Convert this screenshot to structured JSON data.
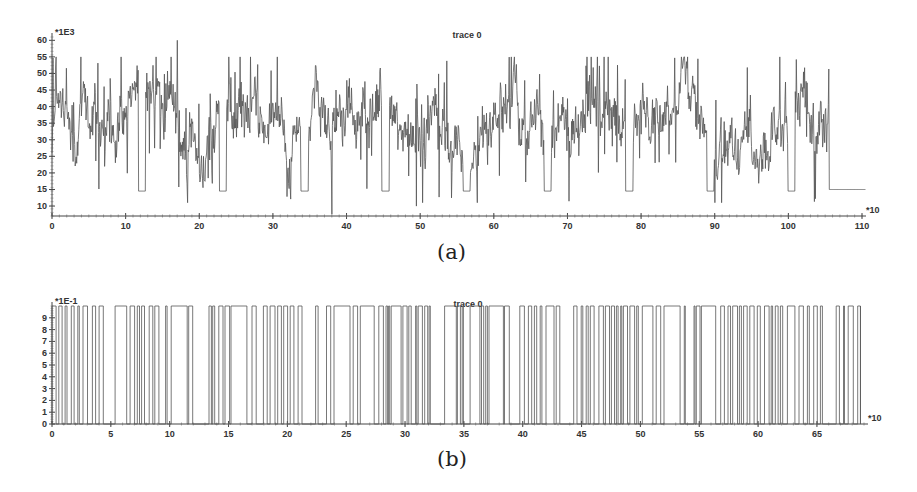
{
  "chart_data": [
    {
      "id": "a",
      "type": "line",
      "title": "trace 0",
      "caption": "(a)",
      "y_multiplier_label": "*1E3",
      "x_multiplier_label": "*10",
      "xlabel": "",
      "ylabel": "",
      "xlim": [
        0,
        110
      ],
      "ylim": [
        7,
        61
      ],
      "x_ticks": [
        0,
        10,
        20,
        30,
        40,
        50,
        60,
        70,
        80,
        90,
        100,
        110
      ],
      "y_ticks": [
        10,
        15,
        20,
        25,
        30,
        35,
        40,
        45,
        50,
        55,
        60
      ],
      "grid": false,
      "description": "Noisy signal oscillating mostly between ~15 and ~55 (x1E3), mean ~33, with periodic flat plateaus at ~14.5 (x1E3) about every 11 units; after x~105.5 the signal stays flat at ~15.",
      "plateaus": [
        {
          "x_start": 11.7,
          "x_end": 12.7,
          "y": 14.5
        },
        {
          "x_start": 22.7,
          "x_end": 23.7,
          "y": 14.5
        },
        {
          "x_start": 33.8,
          "x_end": 34.8,
          "y": 14.5
        },
        {
          "x_start": 44.8,
          "x_end": 45.8,
          "y": 14.5
        },
        {
          "x_start": 55.8,
          "x_end": 56.8,
          "y": 14.5
        },
        {
          "x_start": 66.8,
          "x_end": 67.8,
          "y": 14.5
        },
        {
          "x_start": 77.9,
          "x_end": 78.9,
          "y": 14.5
        },
        {
          "x_start": 88.9,
          "x_end": 89.9,
          "y": 14.5
        },
        {
          "x_start": 99.9,
          "x_end": 100.9,
          "y": 14.5
        },
        {
          "x_start": 105.5,
          "x_end": 110.5,
          "y": 15
        }
      ],
      "notable_points": [
        {
          "x": 17,
          "y": 60,
          "note": "global max"
        },
        {
          "x": 38,
          "y": 7.5,
          "note": "global min spike"
        },
        {
          "x": 49.5,
          "y": 10,
          "note": "low spike"
        }
      ],
      "series": [
        {
          "name": "trace 0",
          "mean": 33,
          "min": 7.5,
          "max": 60,
          "color": "#555555"
        }
      ]
    },
    {
      "id": "b",
      "type": "line",
      "title": "trace 0",
      "caption": "(b)",
      "y_multiplier_label": "*1E-1",
      "x_multiplier_label": "*10",
      "xlabel": "",
      "ylabel": "",
      "xlim": [
        0,
        69
      ],
      "ylim": [
        0,
        10
      ],
      "x_ticks": [
        0,
        5,
        10,
        15,
        20,
        25,
        30,
        35,
        40,
        45,
        50,
        55,
        60,
        65
      ],
      "y_ticks": [
        0,
        1,
        2,
        3,
        4,
        5,
        6,
        7,
        8,
        9
      ],
      "grid": false,
      "description": "Binary square-wave signal switching between 0 and 1.0 (10 x1E-1) at irregular intervals across x=0..~69 (x10); dense switching regions with occasional wider pulses (e.g. near x=33).",
      "levels": [
        0,
        10
      ],
      "series": [
        {
          "name": "trace 0",
          "values_range": [
            0,
            10
          ],
          "color": "#555555"
        }
      ]
    }
  ]
}
